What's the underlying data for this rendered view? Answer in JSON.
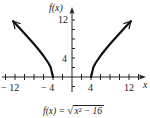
{
  "chart_data": {
    "type": "line",
    "title": "",
    "function": "f(x) = sqrt(x^2 - 16)",
    "caption": {
      "lhs": "f(x) =",
      "radicand": "x² − 16"
    },
    "xlabel": "x",
    "ylabel": "f(x)",
    "xlim": [
      -15,
      15
    ],
    "ylim": [
      -4,
      14
    ],
    "x_tick_step": 2,
    "y_tick_step": 2,
    "x_tick_labels": [
      "− 12",
      "− 4",
      "4",
      "12"
    ],
    "y_tick_labels": [
      "4",
      "12"
    ],
    "grid": false,
    "legend": null,
    "series": [
      {
        "name": "left branch",
        "x": [
          -4,
          -4.5,
          -5,
          -6,
          -7,
          -8,
          -9,
          -10,
          -11,
          -12,
          -12.4
        ],
        "y": [
          0,
          2.06,
          3,
          4.47,
          5.74,
          6.93,
          8.06,
          9.17,
          10.25,
          11.31,
          11.74
        ],
        "arrow_end": true
      },
      {
        "name": "right branch",
        "x": [
          4,
          4.5,
          5,
          6,
          7,
          8,
          9,
          10,
          11,
          12,
          12.4
        ],
        "y": [
          0,
          2.06,
          3,
          4.47,
          5.74,
          6.93,
          8.06,
          9.17,
          10.25,
          11.31,
          11.74
        ],
        "arrow_end": true
      }
    ],
    "line_color": "#111111",
    "axis_color": "#222222"
  },
  "labels": {
    "y_axis_title": "f(x)",
    "x_axis_title": "x",
    "x_neg12": "− 12",
    "x_neg4": "− 4",
    "x_pos4": "4",
    "x_pos12": "12",
    "y_4": "4",
    "y_12": "12",
    "formula_lhs": "f(x) =",
    "formula_radicand": "x² − 16"
  }
}
